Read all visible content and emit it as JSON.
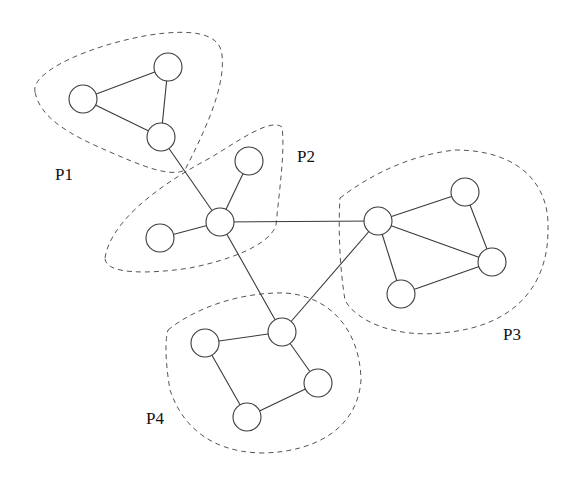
{
  "diagram": {
    "type": "graph-partitioning",
    "node_radius": 14,
    "nodes": [
      {
        "id": "a1",
        "partition": "P1",
        "x": 83,
        "y": 99
      },
      {
        "id": "a2",
        "partition": "P1",
        "x": 168,
        "y": 67
      },
      {
        "id": "a3",
        "partition": "P1",
        "x": 161,
        "y": 137
      },
      {
        "id": "b1",
        "partition": "P2",
        "x": 249,
        "y": 161
      },
      {
        "id": "b2",
        "partition": "P2",
        "x": 220,
        "y": 222
      },
      {
        "id": "b3",
        "partition": "P2",
        "x": 160,
        "y": 238
      },
      {
        "id": "c1",
        "partition": "P3",
        "x": 378,
        "y": 221
      },
      {
        "id": "c2",
        "partition": "P3",
        "x": 465,
        "y": 192
      },
      {
        "id": "c3",
        "partition": "P3",
        "x": 492,
        "y": 262
      },
      {
        "id": "c4",
        "partition": "P3",
        "x": 401,
        "y": 294
      },
      {
        "id": "d1",
        "partition": "P4",
        "x": 282,
        "y": 332
      },
      {
        "id": "d2",
        "partition": "P4",
        "x": 205,
        "y": 343
      },
      {
        "id": "d3",
        "partition": "P4",
        "x": 318,
        "y": 383
      },
      {
        "id": "d4",
        "partition": "P4",
        "x": 247,
        "y": 417
      }
    ],
    "edges": [
      [
        "a1",
        "a2"
      ],
      [
        "a2",
        "a3"
      ],
      [
        "a1",
        "a3"
      ],
      [
        "a3",
        "b2"
      ],
      [
        "b1",
        "b2"
      ],
      [
        "b3",
        "b2"
      ],
      [
        "b2",
        "c1"
      ],
      [
        "b2",
        "d1"
      ],
      [
        "c1",
        "c2"
      ],
      [
        "c2",
        "c3"
      ],
      [
        "c1",
        "c3"
      ],
      [
        "c1",
        "c4"
      ],
      [
        "c4",
        "c3"
      ],
      [
        "c1",
        "d1"
      ],
      [
        "d1",
        "d2"
      ],
      [
        "d1",
        "d3"
      ],
      [
        "d2",
        "d4"
      ],
      [
        "d4",
        "d3"
      ]
    ],
    "partitions": [
      {
        "label": "P1",
        "label_x": 55,
        "label_y": 180
      },
      {
        "label": "P2",
        "label_x": 297,
        "label_y": 162
      },
      {
        "label": "P3",
        "label_x": 503,
        "label_y": 340
      },
      {
        "label": "P4",
        "label_x": 146,
        "label_y": 424
      }
    ]
  }
}
